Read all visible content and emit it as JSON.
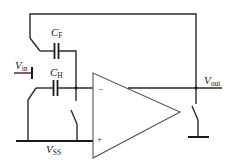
{
  "diagram": {
    "type": "switched-capacitor circuit with op-amp",
    "labels": {
      "cf": {
        "main": "C",
        "sub": "F"
      },
      "ch": {
        "main": "C",
        "sub": "H"
      },
      "vin": {
        "main": "V",
        "sub": "in"
      },
      "vout": {
        "main": "V",
        "sub": "out"
      },
      "vss": {
        "main": "V",
        "sub": "SS"
      }
    },
    "opamp": {
      "inverting_sign": "−",
      "noninverting_sign": "+"
    },
    "colors": {
      "wire": "#2a2a2a",
      "opamp_outline": "#555555",
      "background": "#ffffff"
    }
  }
}
